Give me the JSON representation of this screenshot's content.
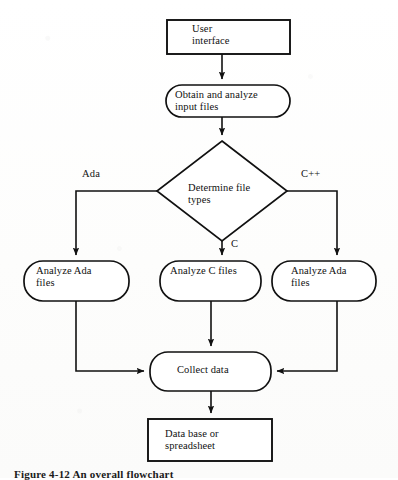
{
  "figure": {
    "caption": "Figure 4-12  An overall flowchart"
  },
  "nodes": {
    "user_interface": {
      "label": "User\ninterface",
      "shape": "rectangle"
    },
    "obtain_analyze": {
      "label": "Obtain and analyze\ninput files",
      "shape": "rounded"
    },
    "determine": {
      "label": "Determine file\ntypes",
      "shape": "diamond"
    },
    "analyze_ada_left": {
      "label": "Analyze Ada\nfiles",
      "shape": "rounded"
    },
    "analyze_c": {
      "label": "Analyze C files",
      "shape": "rounded"
    },
    "analyze_ada_right": {
      "label": "Analyze Ada\nfiles",
      "shape": "rounded"
    },
    "collect_data": {
      "label": "Collect data",
      "shape": "rounded"
    },
    "database": {
      "label": "Data base or\nspreadsheet",
      "shape": "rectangle"
    }
  },
  "edge_labels": {
    "ada": "Ada",
    "c": "C",
    "cpp": "C++"
  },
  "colors": {
    "stroke": "#111111",
    "text": "#111111",
    "background": "#ffffff"
  }
}
